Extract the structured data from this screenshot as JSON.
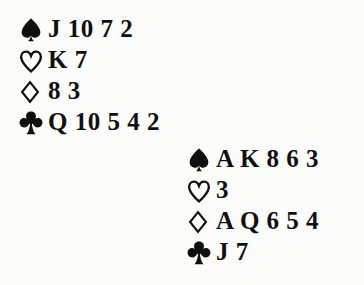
{
  "diagram": {
    "hands": [
      {
        "position": "north",
        "name": "north-hand",
        "suits": [
          {
            "suit": "spades",
            "symbol": "spade-icon",
            "filled": true,
            "ranks": [
              "J",
              "10",
              "7",
              "2"
            ],
            "ranks_text": "J 10 7 2"
          },
          {
            "suit": "hearts",
            "symbol": "heart-icon",
            "filled": false,
            "ranks": [
              "K",
              "7"
            ],
            "ranks_text": "K 7"
          },
          {
            "suit": "diamonds",
            "symbol": "diamond-icon",
            "filled": false,
            "ranks": [
              "8",
              "3"
            ],
            "ranks_text": "8 3"
          },
          {
            "suit": "clubs",
            "symbol": "club-icon",
            "filled": true,
            "ranks": [
              "Q",
              "10",
              "5",
              "4",
              "2"
            ],
            "ranks_text": "Q 10 5 4 2"
          }
        ]
      },
      {
        "position": "south",
        "name": "south-hand",
        "suits": [
          {
            "suit": "spades",
            "symbol": "spade-icon",
            "filled": true,
            "ranks": [
              "A",
              "K",
              "8",
              "6",
              "3"
            ],
            "ranks_text": "A K 8 6 3"
          },
          {
            "suit": "hearts",
            "symbol": "heart-icon",
            "filled": false,
            "ranks": [
              "3"
            ],
            "ranks_text": "3"
          },
          {
            "suit": "diamonds",
            "symbol": "diamond-icon",
            "filled": false,
            "ranks": [
              "A",
              "Q",
              "6",
              "5",
              "4"
            ],
            "ranks_text": "A Q 6 5 4"
          },
          {
            "suit": "clubs",
            "symbol": "club-icon",
            "filled": true,
            "ranks": [
              "J",
              "7"
            ],
            "ranks_text": "J 7"
          }
        ]
      }
    ],
    "colors": {
      "ink": "#111010",
      "background": "#fcfcfb"
    }
  }
}
